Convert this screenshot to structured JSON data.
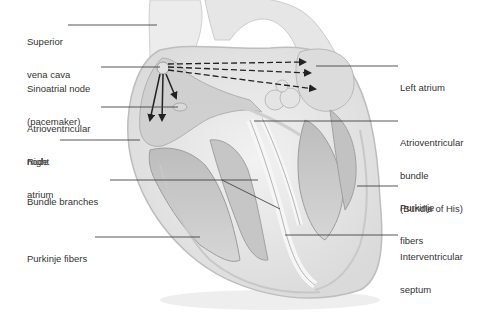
{
  "diagram": {
    "colors": {
      "background": "#ffffff",
      "text": "#333333",
      "leader_line": "#444444",
      "heart_fill": "#e9e9e9",
      "chamber_fill": "#cfcfcf",
      "arrow": "#222222"
    },
    "labels_left": [
      {
        "id": "superior-vena-cava",
        "lines": [
          "Superior",
          "vena cava"
        ]
      },
      {
        "id": "sinoatrial-node",
        "lines": [
          "Sinoatrial node",
          "(pacemaker)"
        ]
      },
      {
        "id": "atrioventricular-node",
        "lines": [
          "Atrioventricular",
          "node"
        ]
      },
      {
        "id": "right-atrium",
        "lines": [
          "Right",
          "atrium"
        ]
      },
      {
        "id": "bundle-branches",
        "lines": [
          "Bundle branches"
        ]
      },
      {
        "id": "purkinje-fibers-left",
        "lines": [
          "Purkinje fibers"
        ]
      }
    ],
    "labels_right": [
      {
        "id": "left-atrium",
        "lines": [
          "Left atrium"
        ]
      },
      {
        "id": "atrioventricular-bundle",
        "lines": [
          "Atrioventricular",
          "bundle",
          "(Bundle of His)"
        ]
      },
      {
        "id": "purkinje-fibers-right",
        "lines": [
          "Purkinje",
          "fibers"
        ]
      },
      {
        "id": "interventricular-septum",
        "lines": [
          "Interventricular",
          "septum"
        ]
      }
    ],
    "arrows": {
      "solid_from_sa_node_downward": 3,
      "dashed_from_sa_node_to_left_atrium": 3
    }
  }
}
